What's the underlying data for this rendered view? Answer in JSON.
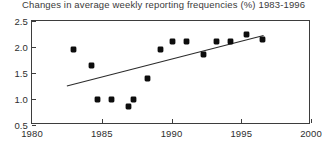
{
  "chart_data": {
    "type": "scatter",
    "title": "Changes in average weekly reporting frequencies (%) 1983-1996",
    "xlabel": "",
    "ylabel": "",
    "xlim": [
      1980,
      2000
    ],
    "ylim": [
      0.5,
      2.5
    ],
    "xticks": [
      1980,
      1985,
      1990,
      1995,
      2000
    ],
    "xtick_labels": [
      "1980",
      "1985",
      "1990",
      "1995",
      "2000"
    ],
    "yticks": [
      0.5,
      1.0,
      1.5,
      2.0,
      2.5
    ],
    "ytick_labels": [
      "0.5",
      "1.0",
      "1.5",
      "2.0",
      "2.5"
    ],
    "grid": false,
    "legend": false,
    "series": [
      {
        "name": "Average weekly reporting frequency",
        "marker": "filled-diamond",
        "color": "#0d0d0d",
        "points": [
          {
            "x": 1983.0,
            "y": 1.95
          },
          {
            "x": 1984.3,
            "y": 1.65
          },
          {
            "x": 1984.7,
            "y": 1.0
          },
          {
            "x": 1985.7,
            "y": 1.0
          },
          {
            "x": 1986.9,
            "y": 0.85
          },
          {
            "x": 1987.3,
            "y": 1.0
          },
          {
            "x": 1988.3,
            "y": 1.4
          },
          {
            "x": 1989.2,
            "y": 1.95
          },
          {
            "x": 1990.1,
            "y": 2.1
          },
          {
            "x": 1991.1,
            "y": 2.1
          },
          {
            "x": 1992.3,
            "y": 1.85
          },
          {
            "x": 1993.2,
            "y": 2.1
          },
          {
            "x": 1994.2,
            "y": 2.1
          },
          {
            "x": 1995.4,
            "y": 2.25
          },
          {
            "x": 1996.5,
            "y": 2.15
          }
        ]
      }
    ],
    "trendline": {
      "name": "linear-fit",
      "color": "#2b2b2b",
      "x_start": 1982.5,
      "y_start": 1.25,
      "x_end": 1996.6,
      "y_end": 2.22
    }
  }
}
